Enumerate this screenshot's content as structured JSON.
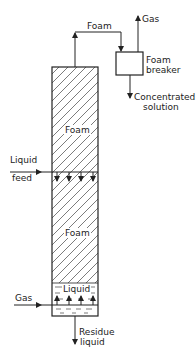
{
  "diagram": {
    "type": "foam fractionation column",
    "labels": {
      "foam_top": "Foam",
      "gas_top": "Gas",
      "foam_breaker_line1": "Foam",
      "foam_breaker_line2": "breaker",
      "concentrated_line1": "Concentrated",
      "concentrated_line2": "solution",
      "foam_upper": "Foam",
      "liquid_feed_line1": "Liquid",
      "liquid_feed_line2": "feed",
      "foam_lower": "Foam",
      "liquid_pool": "Liquid",
      "gas_inlet": "Gas",
      "residue_line1": "Residue",
      "residue_line2": "liquid"
    },
    "colors": {
      "line": "#222222",
      "background": "#ffffff"
    }
  }
}
